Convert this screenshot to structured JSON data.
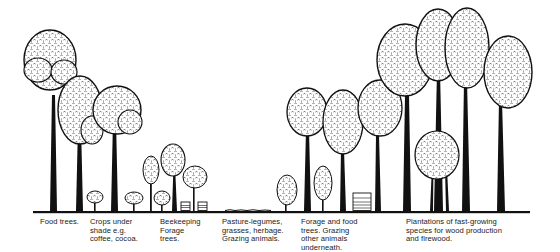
{
  "figure": {
    "type": "agroforestry-systems-illustration",
    "ground_color": "#111111",
    "foliage_fill": "#ffffff",
    "ink_color": "#111111"
  },
  "zones": [
    {
      "id": "food-trees",
      "caption": "Food trees."
    },
    {
      "id": "crops-under-shade",
      "caption": "Crops under\nshade e.g.\ncoffee, cocoa."
    },
    {
      "id": "beekeeping",
      "caption": "Beekeeping\nForage\ntrees."
    },
    {
      "id": "pasture",
      "caption": "Pasture-legumes,\ngrasses, herbage.\nGrazing animals."
    },
    {
      "id": "forage-food",
      "caption": "Forage and food\ntrees. Grazing\nother animals\nunderneath."
    },
    {
      "id": "plantations",
      "caption": "Plantations of fast-growing\nspecies for wood production\nand firewood."
    }
  ]
}
